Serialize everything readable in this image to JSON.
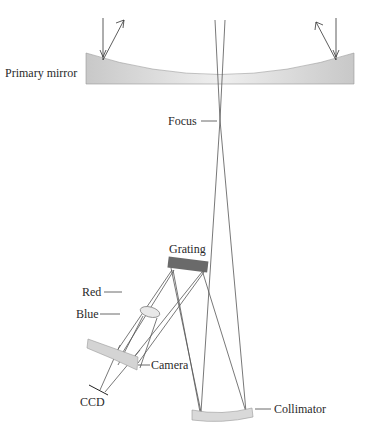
{
  "diagram": {
    "labels": {
      "primary_mirror": "Primary mirror",
      "focus": "Focus",
      "grating": "Grating",
      "red": "Red",
      "blue": "Blue",
      "camera": "Camera",
      "ccd": "CCD",
      "collimator": "Collimator"
    },
    "colors": {
      "mirror_fill": "#d9d9d9",
      "grating_fill": "#6a6a6a",
      "ray": "#555555",
      "text": "#2a2a2a"
    }
  }
}
